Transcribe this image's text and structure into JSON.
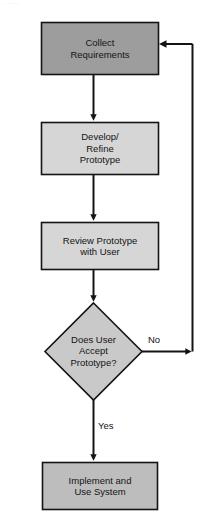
{
  "diagram": {
    "title_fragment": "· ···· ··",
    "background_color": "#ffffff",
    "stroke_color": "#141414",
    "type": "flowchart",
    "orientation": "top-to-bottom",
    "nodes": [
      {
        "id": "collect",
        "shape": "rectangle",
        "label": "Collect\nRequirements",
        "fill": "#9d9d9d",
        "x": 41,
        "y": 22,
        "width": 118,
        "height": 53
      },
      {
        "id": "develop",
        "shape": "rectangle",
        "label": "Develop/\nRefine\nPrototype",
        "fill": "#d6d6d6",
        "x": 41,
        "y": 122,
        "width": 118,
        "height": 53
      },
      {
        "id": "review",
        "shape": "rectangle",
        "label": "Review Prototype\nwith User",
        "fill": "#d6d6d6",
        "x": 41,
        "y": 222,
        "width": 118,
        "height": 48
      },
      {
        "id": "decision",
        "shape": "diamond",
        "label": "Does User\nAccept\nPrototype?",
        "fill": "#c9c9c9",
        "x": 45,
        "y": 303,
        "width": 97,
        "height": 97
      },
      {
        "id": "implement",
        "shape": "rectangle",
        "label": "Implement and\nUse System",
        "fill": "#bdbdbd",
        "x": 42,
        "y": 462,
        "width": 116,
        "height": 48
      }
    ],
    "edges": [
      {
        "id": "collect-to-develop",
        "from": "collect",
        "to": "develop",
        "label": ""
      },
      {
        "id": "develop-to-review",
        "from": "develop",
        "to": "review",
        "label": ""
      },
      {
        "id": "review-to-decision",
        "from": "review",
        "to": "decision",
        "label": ""
      },
      {
        "id": "decision-no-loop",
        "from": "decision",
        "to": "collect",
        "label": "No"
      },
      {
        "id": "decision-yes",
        "from": "decision",
        "to": "implement",
        "label": "Yes"
      }
    ],
    "edge_labels": {
      "no": "No",
      "yes": "Yes"
    }
  }
}
